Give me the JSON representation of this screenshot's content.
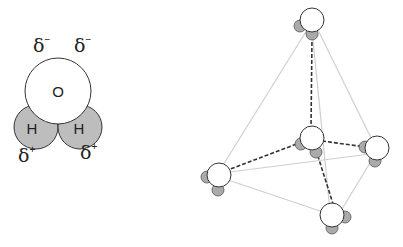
{
  "water_molecule": {
    "oxygen_label": "O",
    "hydrogen_left_label": "H",
    "hydrogen_right_label": "H",
    "charges": {
      "top_left": {
        "symbol": "δ",
        "sign": "−"
      },
      "top_right": {
        "symbol": "δ",
        "sign": "−"
      },
      "bottom_left": {
        "symbol": "δ",
        "sign": "+"
      },
      "bottom_right": {
        "symbol": "δ",
        "sign": "+"
      }
    },
    "colors": {
      "oxygen": "#ffffff",
      "hydrogen": "#bdbdbd",
      "outline": "#333333"
    }
  },
  "tetrahedral_cluster": {
    "molecules": [
      {
        "id": "top",
        "cx": 312,
        "cy": 17
      },
      {
        "id": "center",
        "cx": 312,
        "cy": 138
      },
      {
        "id": "right",
        "cx": 375,
        "cy": 147
      },
      {
        "id": "left",
        "cx": 218,
        "cy": 173
      },
      {
        "id": "bottom",
        "cx": 337,
        "cy": 217
      }
    ],
    "hydrogen_bonds": [
      [
        "center",
        "top"
      ],
      [
        "center",
        "right"
      ],
      [
        "center",
        "left"
      ],
      [
        "center",
        "bottom"
      ]
    ],
    "tetrahedron_edges": [
      [
        "top",
        "left"
      ],
      [
        "top",
        "right"
      ],
      [
        "top",
        "bottom"
      ],
      [
        "left",
        "right"
      ],
      [
        "left",
        "bottom"
      ],
      [
        "right",
        "bottom"
      ]
    ],
    "colors": {
      "hbond": "#333333",
      "edge": "#cfcfcf"
    }
  }
}
